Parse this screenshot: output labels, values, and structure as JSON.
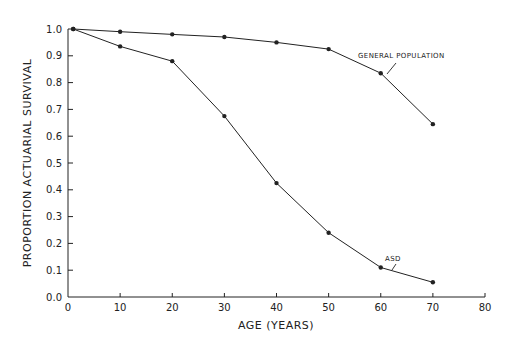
{
  "chart_data": {
    "type": "line",
    "title": "",
    "xlabel": "AGE (YEARS)",
    "ylabel": "PROPORTION ACTUARIAL SURVIVAL",
    "xlim": [
      0,
      80
    ],
    "ylim": [
      0.0,
      1.0
    ],
    "xticks": [
      0,
      10,
      20,
      30,
      40,
      50,
      60,
      70,
      80
    ],
    "xtick_labels": [
      "0",
      "10",
      "20",
      "30",
      "40",
      "50",
      "60",
      "70",
      "80"
    ],
    "yticks": [
      0.0,
      0.1,
      0.2,
      0.3,
      0.4,
      0.5,
      0.6,
      0.7,
      0.8,
      0.9,
      1.0
    ],
    "ytick_labels": [
      "0.0",
      "0.1",
      "0.2",
      "0.3",
      "0.4",
      "0.5",
      "0.6",
      "0.7",
      "0.8",
      "0.9",
      "1.0"
    ],
    "grid": false,
    "legend": "none (direct line annotations)",
    "series": [
      {
        "name": "GENERAL POPULATION",
        "x": [
          1,
          10,
          20,
          30,
          40,
          50,
          60,
          70
        ],
        "values": [
          1.0,
          0.99,
          0.98,
          0.97,
          0.95,
          0.925,
          0.835,
          0.645
        ]
      },
      {
        "name": "ASD",
        "x": [
          1,
          10,
          20,
          30,
          40,
          50,
          60,
          70
        ],
        "values": [
          1.0,
          0.935,
          0.88,
          0.675,
          0.425,
          0.24,
          0.11,
          0.055
        ]
      }
    ],
    "annotations": [
      {
        "text": "GENERAL POPULATION",
        "points_to": {
          "series": "GENERAL POPULATION",
          "x": 60
        }
      },
      {
        "text": "ASD",
        "points_to": {
          "series": "ASD",
          "x": 60
        }
      }
    ]
  },
  "colors": {
    "line": "#222222",
    "background": "#ffffff"
  }
}
